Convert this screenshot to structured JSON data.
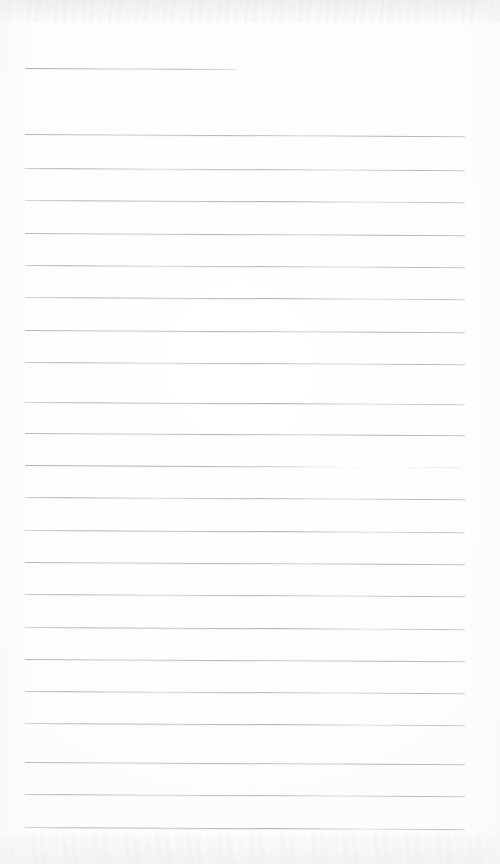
{
  "document": {
    "kind": "scanned-lined-notebook-page",
    "title": "Blank Ruled Notebook Page",
    "content_text": "",
    "handwriting_present": "no",
    "page_width_px": 500,
    "page_height_px": 864,
    "colors": {
      "paper": "#fdfdfd",
      "rule_ink": "#aeb2ba",
      "scan_edge_noise": "#d6d8dc"
    },
    "ruling": {
      "line_count": 23,
      "left_margin_px": 25,
      "right_edge_px": 465,
      "line_spacing_px": 32,
      "line_thickness_px": 1,
      "slope_deg": 0.28,
      "note": "one short header rule near the top, then evenly spaced full-width rules"
    },
    "scan_artifacts": {
      "top_edge_band": "mottled grey scanner noise",
      "bottom_edge_band": "mottled grey scanner noise",
      "vignette": "soft left and right edge falloff"
    }
  },
  "rules": [
    {
      "id": "header-rule",
      "y": 68,
      "x": 25,
      "width": 212,
      "variant": "header-rule"
    },
    {
      "id": "rule-01",
      "y": 134,
      "x": 25,
      "width": 440,
      "variant": "v1"
    },
    {
      "id": "rule-02",
      "y": 168,
      "x": 25,
      "width": 440,
      "variant": "v2"
    },
    {
      "id": "rule-03",
      "y": 200,
      "x": 25,
      "width": 440,
      "variant": "v3"
    },
    {
      "id": "rule-04",
      "y": 233,
      "x": 25,
      "width": 440,
      "variant": "v1"
    },
    {
      "id": "rule-05",
      "y": 265,
      "x": 25,
      "width": 440,
      "variant": "v2"
    },
    {
      "id": "rule-06",
      "y": 297,
      "x": 25,
      "width": 440,
      "variant": "v3"
    },
    {
      "id": "rule-07",
      "y": 330,
      "x": 25,
      "width": 440,
      "variant": "v1"
    },
    {
      "id": "rule-08",
      "y": 362,
      "x": 25,
      "width": 440,
      "variant": "v2"
    },
    {
      "id": "rule-09",
      "y": 402,
      "x": 25,
      "width": 440,
      "variant": "v3"
    },
    {
      "id": "rule-10",
      "y": 433,
      "x": 25,
      "width": 440,
      "variant": "v1"
    },
    {
      "id": "rule-11",
      "y": 465,
      "x": 25,
      "width": 440,
      "variant": "faded-mid"
    },
    {
      "id": "rule-12",
      "y": 497,
      "x": 25,
      "width": 440,
      "variant": "v2"
    },
    {
      "id": "rule-13",
      "y": 530,
      "x": 25,
      "width": 440,
      "variant": "v3"
    },
    {
      "id": "rule-14",
      "y": 562,
      "x": 25,
      "width": 440,
      "variant": "v1"
    },
    {
      "id": "rule-15",
      "y": 594,
      "x": 25,
      "width": 440,
      "variant": "v2"
    },
    {
      "id": "rule-16",
      "y": 627,
      "x": 25,
      "width": 440,
      "variant": "v3"
    },
    {
      "id": "rule-17",
      "y": 659,
      "x": 25,
      "width": 440,
      "variant": "v1"
    },
    {
      "id": "rule-18",
      "y": 691,
      "x": 25,
      "width": 440,
      "variant": "v2"
    },
    {
      "id": "rule-19",
      "y": 723,
      "x": 25,
      "width": 440,
      "variant": "v3"
    },
    {
      "id": "rule-20",
      "y": 762,
      "x": 25,
      "width": 440,
      "variant": "v1"
    },
    {
      "id": "rule-21",
      "y": 794,
      "x": 25,
      "width": 440,
      "variant": "v2"
    },
    {
      "id": "rule-22",
      "y": 827,
      "x": 25,
      "width": 440,
      "variant": "v3"
    }
  ]
}
